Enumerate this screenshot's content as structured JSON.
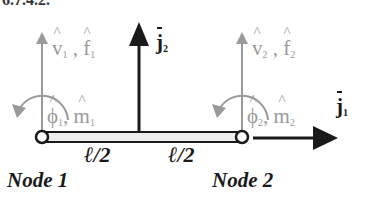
{
  "header": {
    "clipped_text": "6.7.4.2."
  },
  "diagram": {
    "type": "beam-element-dof",
    "colors": {
      "background": "#ffffff",
      "local_dof": "#9a9a9a",
      "global_axis": "#1a1a1a",
      "beam_fill": "#eeeeee"
    },
    "nodes": [
      {
        "label": "Node 1",
        "x": 42,
        "y": 137
      },
      {
        "label": "Node 2",
        "x": 242,
        "y": 137
      }
    ],
    "segments": [
      {
        "label": "ℓ/2"
      },
      {
        "label": "ℓ/2"
      }
    ],
    "dof_labels": {
      "node1_translation": {
        "v": "v",
        "v_sub": "1",
        "sep": ",",
        "f": "f",
        "f_sub": "1"
      },
      "node1_rotation": {
        "phi": "ϕ",
        "phi_sub": "1",
        "sep": ",",
        "m": "m",
        "m_sub": "1"
      },
      "node2_translation": {
        "v": "v",
        "v_sub": "2",
        "sep": ",",
        "f": "f",
        "f_sub": "2"
      },
      "node2_rotation": {
        "phi": "ϕ",
        "phi_sub": "2",
        "sep": ",",
        "m": "m",
        "m_sub": "2"
      }
    },
    "global_axes": {
      "j1": {
        "symbol": "j",
        "sub": "1",
        "direction": "horizontal"
      },
      "j2": {
        "symbol": "j",
        "sub": "2",
        "direction": "vertical"
      }
    }
  }
}
